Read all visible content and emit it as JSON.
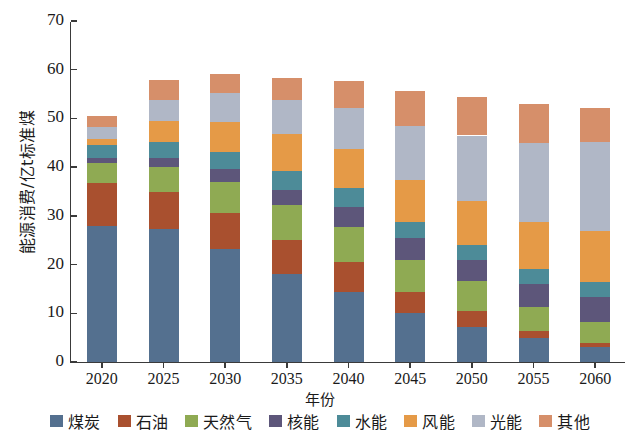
{
  "chart_data": {
    "type": "bar",
    "stacked": true,
    "title": "",
    "xlabel": "年份",
    "ylabel": "能源消费/亿t标准煤",
    "ylim": [
      0,
      70
    ],
    "yticks": [
      0,
      10,
      20,
      30,
      40,
      50,
      60,
      70
    ],
    "grid": false,
    "legend_position": "bottom",
    "categories": [
      "2020",
      "2025",
      "2030",
      "2035",
      "2040",
      "2045",
      "2050",
      "2055",
      "2060"
    ],
    "series": [
      {
        "name": "煤炭",
        "color": "#54708f",
        "values": [
          28.0,
          27.4,
          23.2,
          18.1,
          14.3,
          10.0,
          7.2,
          4.9,
          3.1
        ]
      },
      {
        "name": "石油",
        "color": "#a9502f",
        "values": [
          8.8,
          7.6,
          7.3,
          6.9,
          6.3,
          4.4,
          3.2,
          1.5,
          0.9
        ]
      },
      {
        "name": "天然气",
        "color": "#8faa53",
        "values": [
          4.0,
          5.0,
          6.5,
          7.2,
          7.2,
          6.6,
          6.3,
          4.9,
          4.2
        ]
      },
      {
        "name": "核能",
        "color": "#5d567a",
        "values": [
          1.0,
          1.8,
          2.6,
          3.2,
          4.0,
          4.4,
          4.2,
          4.7,
          5.1
        ]
      },
      {
        "name": "水能",
        "color": "#4d8b98",
        "values": [
          2.8,
          3.3,
          3.5,
          3.8,
          3.9,
          3.3,
          3.1,
          3.1,
          3.1
        ]
      },
      {
        "name": "风能",
        "color": "#e59a47",
        "values": [
          1.1,
          4.3,
          6.2,
          7.6,
          8.1,
          8.6,
          9.0,
          9.6,
          10.4
        ]
      },
      {
        "name": "光能",
        "color": "#b0b7c6",
        "values": [
          2.6,
          4.4,
          6.0,
          6.9,
          8.4,
          11.1,
          13.5,
          16.2,
          18.3
        ]
      },
      {
        "name": "其他",
        "color": "#d68f6a",
        "values": [
          2.2,
          4.0,
          3.9,
          4.6,
          5.4,
          7.3,
          8.0,
          8.0,
          7.0
        ]
      }
    ],
    "totals": [
      50.5,
      57.8,
      59.2,
      58.3,
      57.6,
      55.7,
      54.5,
      52.9,
      52.1
    ]
  },
  "axis": {
    "ylabel": "能源消费/亿t标准煤",
    "xlabel": "年份",
    "ytick_labels": [
      "0",
      "10",
      "20",
      "30",
      "40",
      "50",
      "60",
      "70"
    ],
    "xtick_labels": [
      "2020",
      "2025",
      "2030",
      "2035",
      "2040",
      "2045",
      "2050",
      "2055",
      "2060"
    ]
  },
  "legend": {
    "items": [
      {
        "label": "煤炭",
        "color": "#54708f"
      },
      {
        "label": "石油",
        "color": "#a9502f"
      },
      {
        "label": "天然气",
        "color": "#8faa53"
      },
      {
        "label": "核能",
        "color": "#5d567a"
      },
      {
        "label": "水能",
        "color": "#4d8b98"
      },
      {
        "label": "风能",
        "color": "#e59a47"
      },
      {
        "label": "光能",
        "color": "#b0b7c6"
      },
      {
        "label": "其他",
        "color": "#d68f6a"
      }
    ]
  }
}
